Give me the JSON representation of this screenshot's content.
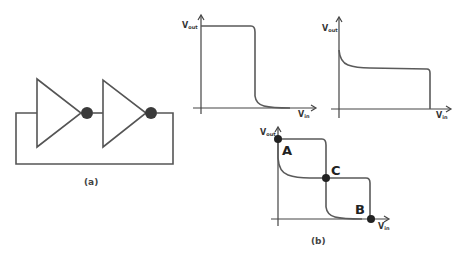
{
  "figure": {
    "panel_a": {
      "caption": "(a)",
      "description": "Two cascaded inverters with output fed back to input (latch)",
      "components": [
        {
          "type": "inverter",
          "name": "inverter-1"
        },
        {
          "type": "inverter",
          "name": "inverter-2"
        }
      ]
    },
    "panel_b": {
      "caption": "(b)",
      "plots": [
        {
          "name": "inverter-1-vtc",
          "ylabel_main": "V",
          "ylabel_sub": "out",
          "xlabel_main": "V",
          "xlabel_sub": "in",
          "description": "Inverter voltage transfer characteristic: high output, sharp drop to low"
        },
        {
          "name": "inverter-2-vtc-mirrored",
          "ylabel_main": "V",
          "ylabel_sub": "out",
          "xlabel_main": "V",
          "xlabel_sub": "in",
          "description": "Mirrored transfer characteristic: sharp drop near origin, plateau, then vertical drop"
        },
        {
          "name": "combined-vtc",
          "ylabel_main": "V",
          "ylabel_sub": "out",
          "xlabel_main": "V",
          "xlabel_sub": "in",
          "points": [
            {
              "label": "A",
              "meaning": "stable point"
            },
            {
              "label": "C",
              "meaning": "metastable point"
            },
            {
              "label": "B",
              "meaning": "stable point"
            }
          ]
        }
      ]
    }
  },
  "colors": {
    "line": "#555555",
    "dot": "#222222",
    "background": "#ffffff"
  }
}
